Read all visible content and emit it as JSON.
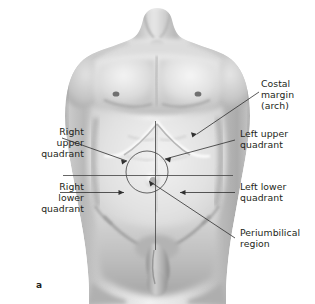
{
  "figure": {
    "letter": "a",
    "background_color": "#ffffff",
    "line_color": "#3a3a3a",
    "text_color": "#231f20"
  },
  "labels": [
    {
      "id": "costal-margin",
      "text": "Costal\nmargin\n(arch)",
      "align": "left",
      "x": 262,
      "y": 80
    },
    {
      "id": "right-upper-quadrant",
      "text": "Right\nupper\nquadrant",
      "align": "right",
      "x": 8,
      "y": 131
    },
    {
      "id": "left-upper-quadrant",
      "text": "Left upper\nquadrant",
      "align": "left",
      "x": 238,
      "y": 133
    },
    {
      "id": "right-lower-quadrant",
      "text": "Right\nlower\nquadrant",
      "align": "right",
      "x": 8,
      "y": 186
    },
    {
      "id": "left-lower-quadrant",
      "text": "Left lower\nquadrant",
      "align": "left",
      "x": 238,
      "y": 186
    },
    {
      "id": "periumbilical-region",
      "text": "Periumbilical\nregion",
      "align": "left",
      "x": 238,
      "y": 232
    }
  ],
  "anatomy_markings": {
    "vertical_midline": "median-line-from-xiphoid-to-pubis",
    "horizontal_line": "transumbilical-line",
    "umbilicus_circle": "periumbilical-region-circle",
    "costal_arch": "costal-margin-curve"
  }
}
